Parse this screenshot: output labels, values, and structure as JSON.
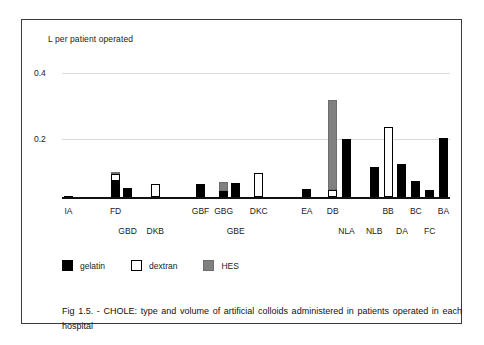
{
  "figure": {
    "caption": "Fig 1.5. - CHOLE: type and volume of artificial colloids administered in patients operated  in each hospital"
  },
  "legend": {
    "items": [
      {
        "key": "gelatin",
        "label": "gelatin",
        "color": "#000000"
      },
      {
        "key": "dextran",
        "label": "dextran",
        "color": "#ffffff"
      },
      {
        "key": "hes",
        "label": "HES",
        "color": "#808080"
      }
    ]
  },
  "axis": {
    "y_title": "L per patient operated",
    "ticks": [
      "0.4",
      "0.2"
    ]
  },
  "chart_data": {
    "type": "bar",
    "title": "Fig 1.5. - CHOLE: type and volume of artificial colloids administered in patients operated in each hospital",
    "xlabel": "",
    "ylabel": "L per patient operated",
    "ylim": [
      0,
      0.45
    ],
    "yticks": [
      0.2,
      0.4
    ],
    "grid": true,
    "stacked": true,
    "legend_position": "below-axis-left",
    "categories": [
      "IA",
      "FD",
      "GBD",
      "DKB",
      "GBF",
      "GBG",
      "GBE",
      "DKC",
      "EA",
      "DB",
      "NLA",
      "NLB",
      "BB",
      "DA",
      "BC",
      "FC",
      "BA"
    ],
    "series": [
      {
        "name": "gelatin",
        "color": "#000000",
        "values": [
          0.003,
          0.052,
          0.028,
          0.0,
          0.041,
          0.021,
          0.045,
          0.0,
          0.025,
          0.0,
          0.188,
          0.098,
          0.0,
          0.107,
          0.052,
          0.022,
          0.19
        ]
      },
      {
        "name": "dextran",
        "color": "#ffffff",
        "values": [
          0.0,
          0.022,
          0.0,
          0.042,
          0.0,
          0.0,
          0.0,
          0.078,
          0.0,
          0.022,
          0.0,
          0.0,
          0.227,
          0.0,
          0.0,
          0.0,
          0.0
        ]
      },
      {
        "name": "HES",
        "color": "#808080",
        "values": [
          0.0,
          0.006,
          0.0,
          0.0,
          0.0,
          0.029,
          0.0,
          0.0,
          0.0,
          0.29,
          0.0,
          0.0,
          0.0,
          0.0,
          0.0,
          0.0,
          0.0
        ]
      }
    ],
    "totals": [
      0.003,
      0.08,
      0.028,
      0.042,
      0.041,
      0.05,
      0.045,
      0.078,
      0.025,
      0.312,
      0.188,
      0.098,
      0.227,
      0.107,
      0.052,
      0.022,
      0.19
    ],
    "label_rows": {
      "row1": [
        "IA",
        "FD",
        "GBF",
        "GBG",
        "DKC",
        "EA",
        "DB",
        "BB",
        "BC",
        "BA"
      ],
      "row2": [
        "GBD",
        "DKB",
        "GBE",
        "NLA",
        "NLB",
        "DA",
        "FC"
      ]
    }
  }
}
